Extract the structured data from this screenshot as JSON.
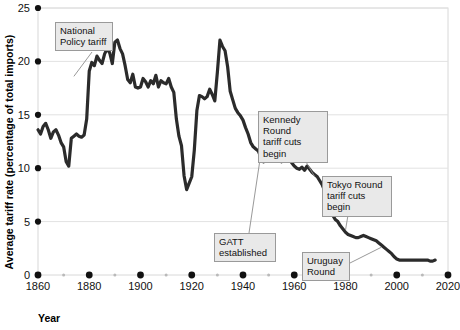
{
  "figure": {
    "background_color": "#ffffff",
    "series_color": "#2b2b2b",
    "gridline_color": "#e2e2e2",
    "frame_color": "#d8d8d8",
    "annotation_fill": "#e9e9e9",
    "annotation_border": "#9a9a9a"
  },
  "chart_data": {
    "type": "line",
    "title": "",
    "xlabel": "Year",
    "ylabel": "Average tariff rate (percentage of total imports)",
    "xlim": [
      1860,
      2020
    ],
    "ylim": [
      0,
      25
    ],
    "grid": true,
    "legend": "none",
    "xticks": [
      1860,
      1880,
      1900,
      1920,
      1940,
      1960,
      1980,
      2000,
      2020
    ],
    "xtick_labels": [
      "1860",
      "1880",
      "1900",
      "1920",
      "1940",
      "1960",
      "1980",
      "2000",
      "2020"
    ],
    "xminor_ticks": [
      1870,
      1890,
      1910,
      1930,
      1950,
      1970,
      1990,
      2010
    ],
    "yticks": [
      0,
      5,
      10,
      15,
      20,
      25
    ],
    "ytick_labels": [
      "0",
      "5",
      "10",
      "15",
      "20",
      "25"
    ],
    "series": [
      {
        "name": "Average tariff rate",
        "x": [
          1860,
          1861,
          1862,
          1863,
          1864,
          1865,
          1866,
          1867,
          1868,
          1869,
          1870,
          1871,
          1872,
          1873,
          1874,
          1875,
          1876,
          1877,
          1878,
          1879,
          1880,
          1881,
          1882,
          1883,
          1884,
          1885,
          1886,
          1887,
          1888,
          1889,
          1890,
          1891,
          1892,
          1893,
          1894,
          1895,
          1896,
          1897,
          1898,
          1899,
          1900,
          1901,
          1902,
          1903,
          1904,
          1905,
          1906,
          1907,
          1908,
          1909,
          1910,
          1911,
          1912,
          1913,
          1914,
          1915,
          1916,
          1917,
          1918,
          1919,
          1920,
          1921,
          1922,
          1923,
          1924,
          1925,
          1926,
          1927,
          1928,
          1929,
          1930,
          1931,
          1932,
          1933,
          1934,
          1935,
          1936,
          1937,
          1938,
          1939,
          1940,
          1941,
          1942,
          1943,
          1944,
          1945,
          1946,
          1947,
          1948,
          1949,
          1950,
          1951,
          1952,
          1953,
          1954,
          1955,
          1956,
          1957,
          1958,
          1959,
          1960,
          1961,
          1962,
          1963,
          1964,
          1965,
          1966,
          1967,
          1968,
          1969,
          1970,
          1971,
          1972,
          1973,
          1974,
          1975,
          1976,
          1977,
          1978,
          1979,
          1980,
          1981,
          1982,
          1983,
          1984,
          1985,
          1986,
          1987,
          1988,
          1989,
          1990,
          1991,
          1992,
          1993,
          1994,
          1995,
          1996,
          1997,
          1998,
          1999,
          2000,
          2001,
          2002,
          2003,
          2004,
          2005,
          2006,
          2007,
          2008,
          2009,
          2010,
          2011,
          2012,
          2013,
          2014,
          2015
        ],
        "y": [
          13.6,
          13.2,
          13.9,
          14.2,
          13.6,
          12.8,
          13.4,
          13.6,
          13.1,
          12.4,
          12.0,
          10.6,
          10.2,
          12.8,
          13.0,
          13.2,
          13.0,
          12.9,
          13.1,
          14.6,
          19.1,
          19.9,
          19.6,
          20.5,
          20.1,
          19.8,
          20.7,
          21.2,
          20.8,
          19.8,
          21.8,
          22.0,
          21.2,
          20.7,
          19.6,
          18.3,
          18.0,
          18.8,
          17.6,
          17.5,
          17.6,
          18.4,
          18.1,
          17.6,
          18.2,
          17.9,
          18.7,
          17.6,
          18.2,
          18.0,
          17.9,
          18.4,
          17.6,
          17.1,
          14.6,
          13.0,
          12.1,
          9.3,
          8.0,
          8.6,
          9.2,
          11.7,
          15.4,
          16.8,
          16.7,
          16.5,
          16.7,
          17.4,
          16.9,
          16.3,
          19.0,
          22.0,
          21.4,
          21.0,
          19.5,
          17.2,
          16.4,
          15.6,
          15.2,
          14.9,
          14.5,
          13.8,
          13.2,
          12.4,
          12.0,
          11.8,
          11.6,
          11.0,
          10.6,
          11.2,
          11.4,
          10.8,
          11.2,
          11.0,
          10.8,
          10.6,
          11.2,
          10.9,
          11.0,
          10.5,
          10.2,
          10.0,
          9.9,
          10.1,
          9.8,
          10.2,
          9.9,
          9.6,
          9.4,
          9.2,
          8.8,
          8.4,
          7.8,
          6.4,
          6.1,
          5.6,
          5.2,
          5.0,
          4.6,
          4.3,
          4.0,
          3.8,
          3.7,
          3.6,
          3.5,
          3.5,
          3.6,
          3.7,
          3.6,
          3.5,
          3.4,
          3.3,
          3.2,
          3.0,
          2.8,
          2.6,
          2.4,
          2.2,
          2.0,
          1.7,
          1.5,
          1.4,
          1.4,
          1.4,
          1.4,
          1.4,
          1.4,
          1.4,
          1.4,
          1.4,
          1.4,
          1.4,
          1.4,
          1.3,
          1.3,
          1.4
        ]
      }
    ],
    "annotations": [
      {
        "id": "national-policy-tariff",
        "text": "National\nPolicy tariff",
        "target_year": 1874,
        "target_value": 18.6
      },
      {
        "id": "kennedy-round",
        "text": "Kennedy Round\ntariff cuts begin",
        "target_year": 1968,
        "target_value": 9.2
      },
      {
        "id": "gatt-established",
        "text": "GATT\nestablished",
        "target_year": 1947,
        "target_value": 11.4
      },
      {
        "id": "tokyo-round",
        "text": "Tokyo Round\ntariff cuts begin",
        "target_year": 1980,
        "target_value": 4.2
      },
      {
        "id": "uruguay-round",
        "text": "Uruguay\nRound",
        "target_year": 1994,
        "target_value": 2.6
      }
    ]
  },
  "axis_titles": {
    "y": "Average tariff rate (percentage of total imports)",
    "x": "Year"
  }
}
